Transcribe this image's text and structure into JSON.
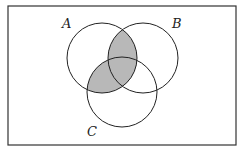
{
  "diagram": {
    "type": "venn",
    "universe": {
      "x": 8,
      "y": 6,
      "width": 228,
      "height": 139,
      "stroke": "#333333"
    },
    "sets": [
      {
        "label": "A",
        "cx": 102,
        "cy": 58,
        "r": 35,
        "label_x": 62,
        "label_y": 28
      },
      {
        "label": "B",
        "cx": 143,
        "cy": 58,
        "r": 35,
        "label_x": 172,
        "label_y": 28
      },
      {
        "label": "C",
        "cx": 122,
        "cy": 92,
        "r": 35,
        "label_x": 87,
        "label_y": 135
      }
    ],
    "shaded_region": "A ∩ (B ∪ C)",
    "shade_color": "#b8b8b8",
    "stroke_color": "#222222"
  }
}
